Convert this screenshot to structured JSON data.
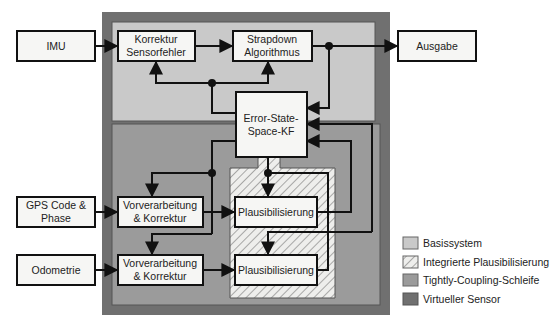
{
  "diagram": {
    "colors": {
      "virtual_sensor": "#707070",
      "basissystem": "#c9c9c9",
      "tightly_coupling": "#9b9b9b",
      "hatch_bg": "#eeeeec",
      "hatch_line": "#777777",
      "box_fill": "#f6f6f4",
      "line": "#111111"
    },
    "blocks": {
      "imu": {
        "label": "IMU"
      },
      "korrektur": {
        "line1": "Korrektur",
        "line2": "Sensorfehler"
      },
      "strapdown": {
        "line1": "Strapdown",
        "line2": "Algorithmus"
      },
      "ausgabe": {
        "label": "Ausgabe"
      },
      "kf": {
        "line1": "Error-State-",
        "line2": "Space-KF"
      },
      "gps": {
        "line1": "GPS Code &",
        "line2": "Phase"
      },
      "odometrie": {
        "label": "Odometrie"
      },
      "vorverarbeitung_gps": {
        "line1": "Vorverarbeitung",
        "line2": "& Korrektur"
      },
      "vorverarbeitung_odo": {
        "line1": "Vorverarbeitung",
        "line2": "& Korrektur"
      },
      "plaus_gps": {
        "label": "Plausibilisierung"
      },
      "plaus_odo": {
        "label": "Plausibilisierung"
      }
    },
    "legend": [
      {
        "label": "Basissystem",
        "swatch": "basissystem"
      },
      {
        "label": "Integrierte Plausibilisierung",
        "swatch": "hatch"
      },
      {
        "label": "Tightly-Coupling-Schleife",
        "swatch": "tightly_coupling"
      },
      {
        "label": "Virtueller Sensor",
        "swatch": "virtual_sensor"
      }
    ]
  }
}
